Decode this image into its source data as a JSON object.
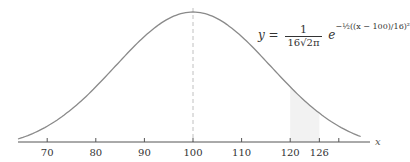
{
  "chart_data": {
    "type": "line",
    "title": "",
    "subtitle": "",
    "xlabel": "x",
    "ylabel": "",
    "mean": 100,
    "sd": 16,
    "x_range": [
      63,
      134
    ],
    "xlim": [
      63,
      134
    ],
    "x_ticks": [
      70,
      80,
      90,
      100,
      110,
      120,
      126,
      130
    ],
    "x_tick_labels": [
      "70",
      "80",
      "90",
      "100",
      "110",
      "120",
      "126",
      ""
    ],
    "shaded_region": [
      120,
      126
    ],
    "dashed_line_at": 100,
    "formula": {
      "lhs": "y =",
      "numerator": "1",
      "denominator": "16√2π",
      "e": "e",
      "exponent": "−½((x − 100)/16)²"
    },
    "grid": false,
    "legend": null,
    "colors": {
      "curve": "#888888",
      "axis": "#555555",
      "dashed": "#bbbbbb",
      "shade": "#f2f2f2"
    }
  },
  "labels": {
    "x_axis": "x",
    "formula_lhs": "y =",
    "formula_num": "1",
    "formula_den": "16√2π",
    "formula_e": "e",
    "formula_exp": "−½((x − 100)/16)²"
  }
}
